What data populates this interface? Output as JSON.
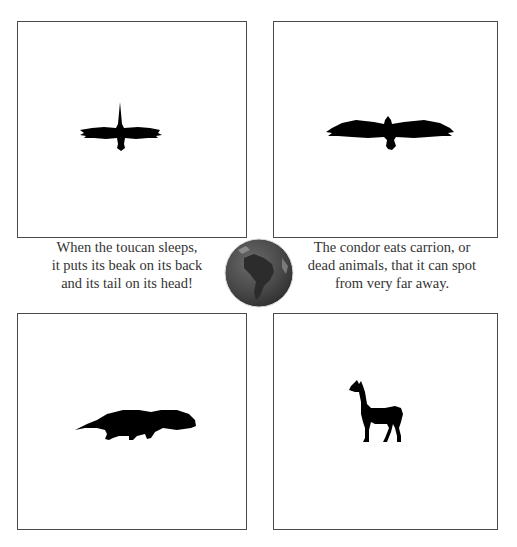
{
  "cards": [
    {
      "position": "top-left",
      "animal": "toucan",
      "icon": "toucan-silhouette-icon"
    },
    {
      "position": "top-right",
      "animal": "condor",
      "icon": "condor-silhouette-icon"
    },
    {
      "position": "bottom-left",
      "animal": "anteater",
      "icon": "anteater-silhouette-icon"
    },
    {
      "position": "bottom-right",
      "animal": "llama",
      "icon": "llama-silhouette-icon"
    }
  ],
  "facts": {
    "left": {
      "line1": "When the toucan sleeps,",
      "line2": "it puts its beak on its back",
      "line3": "and its tail on its head!"
    },
    "right": {
      "line1": "The condor eats carrion, or",
      "line2": "dead animals, that it can spot",
      "line3": "from very far away."
    }
  },
  "globe": {
    "region": "South America",
    "icon": "globe-south-america-icon"
  },
  "colors": {
    "border": "#4a4a4a",
    "silhouette": "#000000",
    "text": "#333333",
    "globe": "#4a4a4a"
  }
}
